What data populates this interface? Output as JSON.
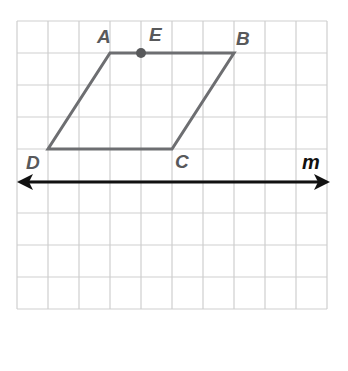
{
  "diagram": {
    "grid": {
      "x0": 17,
      "y0": 21,
      "cell": 31.3,
      "cols": 10,
      "rows": 10,
      "color": "#c8c8c8"
    },
    "shape": {
      "type": "parallelogram",
      "color": "#6d6e71",
      "vertices": {
        "A": [
          110,
          53
        ],
        "B": [
          234,
          53
        ],
        "C": [
          172,
          149
        ],
        "D": [
          48,
          149
        ]
      }
    },
    "point_E": {
      "label": "E",
      "x": 141,
      "y": 53
    },
    "labels": {
      "A": "A",
      "B": "B",
      "C": "C",
      "D": "D",
      "E": "E",
      "m": "m"
    },
    "line_m": {
      "label": "m",
      "y": 182,
      "x1": 17,
      "x2": 329,
      "color": "#111111"
    }
  }
}
